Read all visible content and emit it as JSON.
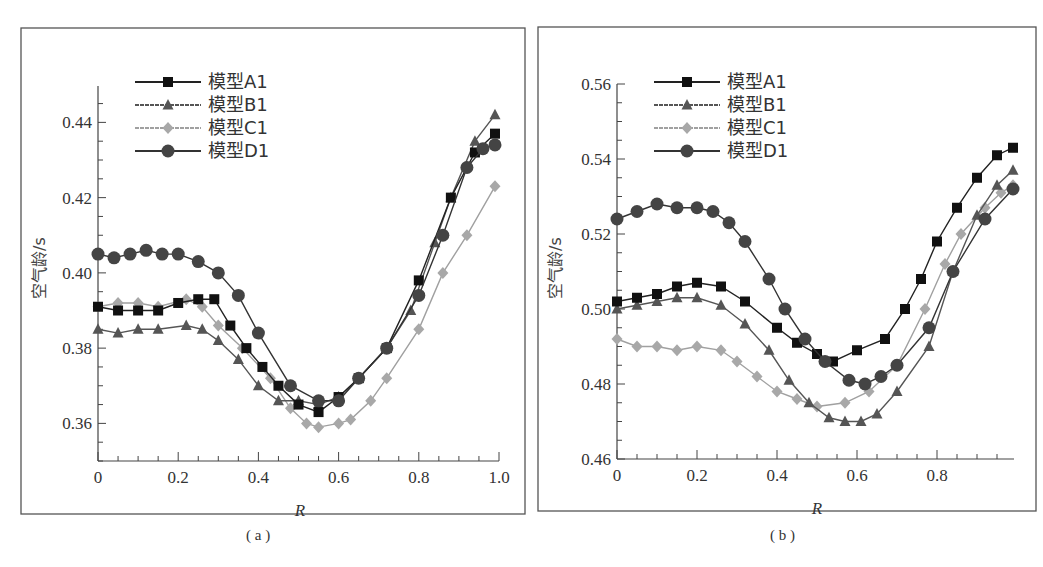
{
  "figure": {
    "captions": [
      "( a )",
      "( b )"
    ]
  },
  "chart_data": [
    {
      "type": "line",
      "panel": "a",
      "caption": "( a )",
      "title": "",
      "xlabel": "R",
      "ylabel": "空气龄/s",
      "xlim": [
        0,
        1.0
      ],
      "ylim": [
        0.35,
        0.45
      ],
      "xticks": [
        0,
        0.2,
        0.4,
        0.6,
        0.8,
        1.0
      ],
      "xtick_labels": [
        "0",
        "0.2",
        "0.4",
        "0.6",
        "0.8",
        "1.0"
      ],
      "yticks": [
        0.36,
        0.38,
        0.4,
        0.42,
        0.44
      ],
      "ytick_labels": [
        "0.36",
        "0.38",
        "0.40",
        "0.42",
        "0.44"
      ],
      "grid": false,
      "legend_position": "upper-left",
      "series": [
        {
          "name": "模型A1",
          "marker": "square",
          "color": "#111111",
          "line": "#222222",
          "x": [
            0,
            0.05,
            0.1,
            0.15,
            0.2,
            0.25,
            0.29,
            0.33,
            0.37,
            0.41,
            0.45,
            0.5,
            0.55,
            0.6,
            0.65,
            0.72,
            0.8,
            0.88,
            0.94,
            0.99
          ],
          "y": [
            0.391,
            0.39,
            0.39,
            0.39,
            0.392,
            0.393,
            0.393,
            0.386,
            0.38,
            0.375,
            0.37,
            0.365,
            0.363,
            0.367,
            0.372,
            0.38,
            0.398,
            0.42,
            0.432,
            0.437
          ]
        },
        {
          "name": "模型B1",
          "marker": "triangle",
          "color": "#555555",
          "line": "#555555",
          "x": [
            0,
            0.05,
            0.1,
            0.15,
            0.22,
            0.26,
            0.3,
            0.35,
            0.4,
            0.45,
            0.5,
            0.55,
            0.6,
            0.65,
            0.72,
            0.78,
            0.84,
            0.88,
            0.94,
            0.99
          ],
          "y": [
            0.385,
            0.384,
            0.385,
            0.385,
            0.386,
            0.385,
            0.382,
            0.377,
            0.37,
            0.366,
            0.366,
            0.365,
            0.367,
            0.372,
            0.38,
            0.39,
            0.408,
            0.42,
            0.435,
            0.442
          ]
        },
        {
          "name": "模型C1",
          "marker": "diamond",
          "color": "#a8a8a8",
          "line": "#a0a0a0",
          "x": [
            0,
            0.05,
            0.1,
            0.15,
            0.22,
            0.26,
            0.3,
            0.36,
            0.43,
            0.48,
            0.52,
            0.55,
            0.6,
            0.63,
            0.68,
            0.72,
            0.8,
            0.86,
            0.92,
            0.99
          ],
          "y": [
            0.391,
            0.392,
            0.392,
            0.391,
            0.393,
            0.391,
            0.386,
            0.38,
            0.372,
            0.364,
            0.36,
            0.359,
            0.36,
            0.361,
            0.366,
            0.372,
            0.385,
            0.4,
            0.41,
            0.423
          ]
        },
        {
          "name": "模型D1",
          "marker": "circle",
          "color": "#444444",
          "line": "#333333",
          "x": [
            0,
            0.04,
            0.08,
            0.12,
            0.16,
            0.2,
            0.25,
            0.3,
            0.35,
            0.4,
            0.48,
            0.55,
            0.6,
            0.65,
            0.72,
            0.8,
            0.86,
            0.92,
            0.96,
            0.99
          ],
          "y": [
            0.405,
            0.404,
            0.405,
            0.406,
            0.405,
            0.405,
            0.403,
            0.4,
            0.394,
            0.384,
            0.37,
            0.366,
            0.366,
            0.372,
            0.38,
            0.394,
            0.41,
            0.428,
            0.433,
            0.434
          ]
        }
      ]
    },
    {
      "type": "line",
      "panel": "b",
      "caption": "( b )",
      "title": "",
      "xlabel": "R",
      "ylabel": "空气龄/s",
      "xlim": [
        0,
        0.99
      ],
      "ylim": [
        0.46,
        0.56
      ],
      "xticks": [
        0,
        0.2,
        0.4,
        0.6,
        0.8
      ],
      "xtick_labels": [
        "0",
        "0.2",
        "0.4",
        "0.6",
        "0.8"
      ],
      "yticks": [
        0.46,
        0.48,
        0.5,
        0.52,
        0.54,
        0.56
      ],
      "ytick_labels": [
        "0.46",
        "0.48",
        "0.50",
        "0.52",
        "0.54",
        "0.56"
      ],
      "grid": false,
      "legend_position": "upper-left",
      "series": [
        {
          "name": "模型A1",
          "marker": "square",
          "color": "#111111",
          "line": "#222222",
          "x": [
            0,
            0.05,
            0.1,
            0.15,
            0.2,
            0.26,
            0.32,
            0.4,
            0.45,
            0.5,
            0.54,
            0.6,
            0.67,
            0.72,
            0.76,
            0.8,
            0.85,
            0.9,
            0.95,
            0.99
          ],
          "y": [
            0.502,
            0.503,
            0.504,
            0.506,
            0.507,
            0.506,
            0.502,
            0.495,
            0.491,
            0.488,
            0.486,
            0.489,
            0.492,
            0.5,
            0.508,
            0.518,
            0.527,
            0.535,
            0.541,
            0.543
          ]
        },
        {
          "name": "模型B1",
          "marker": "triangle",
          "color": "#555555",
          "line": "#555555",
          "x": [
            0,
            0.05,
            0.1,
            0.15,
            0.2,
            0.26,
            0.32,
            0.38,
            0.43,
            0.48,
            0.53,
            0.57,
            0.61,
            0.65,
            0.7,
            0.78,
            0.84,
            0.9,
            0.95,
            0.99
          ],
          "y": [
            0.5,
            0.501,
            0.502,
            0.503,
            0.503,
            0.501,
            0.496,
            0.489,
            0.481,
            0.475,
            0.471,
            0.47,
            0.47,
            0.472,
            0.478,
            0.49,
            0.51,
            0.525,
            0.533,
            0.537
          ]
        },
        {
          "name": "模型C1",
          "marker": "diamond",
          "color": "#a8a8a8",
          "line": "#a0a0a0",
          "x": [
            0,
            0.05,
            0.1,
            0.15,
            0.2,
            0.26,
            0.3,
            0.35,
            0.4,
            0.45,
            0.5,
            0.57,
            0.63,
            0.7,
            0.77,
            0.82,
            0.86,
            0.92,
            0.96,
            0.99
          ],
          "y": [
            0.492,
            0.49,
            0.49,
            0.489,
            0.49,
            0.489,
            0.486,
            0.482,
            0.478,
            0.476,
            0.474,
            0.475,
            0.478,
            0.485,
            0.5,
            0.512,
            0.52,
            0.527,
            0.531,
            0.533
          ]
        },
        {
          "name": "模型D1",
          "marker": "circle",
          "color": "#444444",
          "line": "#333333",
          "x": [
            0,
            0.05,
            0.1,
            0.15,
            0.2,
            0.24,
            0.28,
            0.32,
            0.38,
            0.42,
            0.47,
            0.52,
            0.58,
            0.62,
            0.66,
            0.7,
            0.78,
            0.84,
            0.92,
            0.99
          ],
          "y": [
            0.524,
            0.526,
            0.528,
            0.527,
            0.527,
            0.526,
            0.523,
            0.518,
            0.508,
            0.5,
            0.492,
            0.486,
            0.481,
            0.48,
            0.482,
            0.485,
            0.495,
            0.51,
            0.524,
            0.532
          ]
        }
      ]
    }
  ],
  "layout": {
    "panels": [
      {
        "frame": [
          21,
          28,
          525,
          514
        ],
        "origin": [
          98,
          461
        ],
        "xscale": 401,
        "ypx_per_unit": 3762.5,
        "yaxis_top": 86,
        "xaxis_end": 499,
        "minor_x": 0.05,
        "minor_y": 0.005,
        "label_x": 300,
        "label_y": 500,
        "ylabel_x": 45,
        "ylabel_y": 268,
        "legend_x": 135,
        "legend_y": 82,
        "caption_x": 256,
        "caption_y": 527
      },
      {
        "frame": [
          538,
          27,
          1036,
          511
        ],
        "origin": [
          617,
          459
        ],
        "xscale": 400,
        "ypx_per_unit": 3750,
        "yaxis_top": 84,
        "xaxis_end": 1014,
        "minor_x": 0.05,
        "minor_y": 0.005,
        "label_x": 817,
        "label_y": 498,
        "ylabel_x": 561,
        "ylabel_y": 268,
        "legend_x": 654,
        "legend_y": 82,
        "caption_x": 779,
        "caption_y": 527
      }
    ]
  }
}
